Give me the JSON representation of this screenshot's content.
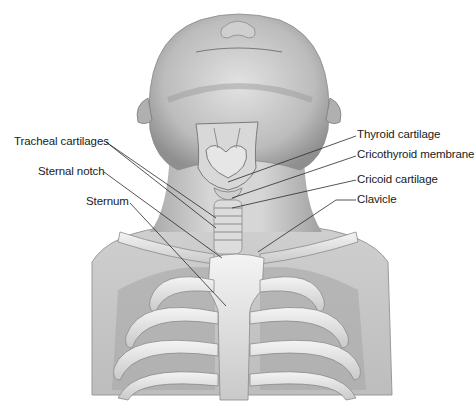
{
  "figure": {
    "labels_left": [
      {
        "id": "tracheal-cartilages",
        "text": "Tracheal cartilages"
      },
      {
        "id": "sternal-notch",
        "text": "Sternal notch"
      },
      {
        "id": "sternum",
        "text": "Sternum"
      }
    ],
    "labels_right": [
      {
        "id": "thyroid-cartilage",
        "text": "Thyroid cartilage"
      },
      {
        "id": "cricothyroid-membrane",
        "text": "Cricothyroid membrane"
      },
      {
        "id": "cricoid-cartilage",
        "text": "Cricoid cartilage"
      },
      {
        "id": "clavicle",
        "text": "Clavicle"
      }
    ]
  },
  "colors": {
    "background": "#ffffff",
    "skin_light": "#e4e4e4",
    "skin_mid": "#bdbdbd",
    "skin_dark": "#8a8a8a",
    "bone": "#ececec",
    "leader_line": "#2a2a2a",
    "label_text": "#1a1a1a"
  }
}
